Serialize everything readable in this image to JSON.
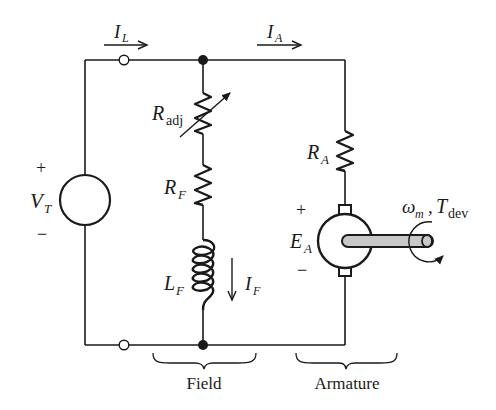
{
  "diagram": {
    "type": "circuit",
    "colors": {
      "line": "#1a1a1a",
      "shaft_fill": "#c8c8c8",
      "background": "#ffffff"
    }
  },
  "currents": {
    "line": {
      "symbol": "I",
      "subscript": "L"
    },
    "armature": {
      "symbol": "I",
      "subscript": "A"
    },
    "field": {
      "symbol": "I",
      "subscript": "F"
    }
  },
  "source": {
    "symbol": "V",
    "subscript": "T",
    "plus": "+",
    "minus": "−"
  },
  "field_circuit": {
    "adjustable_resistor": {
      "symbol": "R",
      "subscript": "adj"
    },
    "resistor": {
      "symbol": "R",
      "subscript": "F"
    },
    "inductor": {
      "symbol": "L",
      "subscript": "F"
    },
    "brace_label": "Field"
  },
  "armature_circuit": {
    "resistor": {
      "symbol": "R",
      "subscript": "A"
    },
    "emf": {
      "symbol": "E",
      "subscript": "A",
      "plus": "+",
      "minus": "−"
    },
    "speed": {
      "symbol": "ω",
      "subscript": "m"
    },
    "separator": ",",
    "torque": {
      "symbol": "T",
      "subscript": "dev"
    },
    "brace_label": "Armature"
  }
}
